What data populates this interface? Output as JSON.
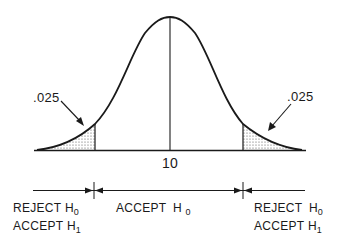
{
  "diagram": {
    "mean_label": "10",
    "left_tail": {
      "area_label": ".025",
      "region_label_line1": "REJECT H",
      "region_label_line1_sub": "0",
      "region_label_line2": "ACCEPT H",
      "region_label_line2_sub": "1"
    },
    "center": {
      "region_label": "ACCEPT H",
      "region_label_sub": "0"
    },
    "right_tail": {
      "area_label": ".025",
      "region_label_line1": "REJECT H",
      "region_label_line1_sub": "0",
      "region_label_line2": "ACCEPT H",
      "region_label_line2_sub": "1"
    },
    "colors": {
      "line": "#1a1a1a",
      "shade": "#9a9a9a",
      "background": "#ffffff"
    }
  }
}
